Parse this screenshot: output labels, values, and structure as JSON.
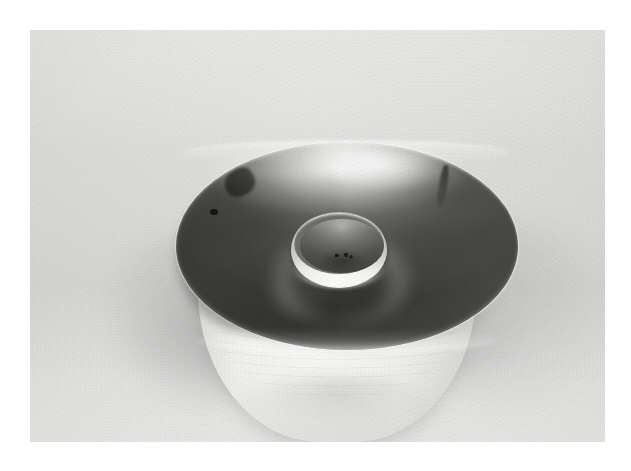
{
  "image": {
    "kind": "photograph",
    "medium": "black-and-white print",
    "subject": "ceramic bowl with raised central well",
    "orientation": "landscape",
    "canvas": {
      "width": 631,
      "height": 471,
      "background": "#ffffff"
    },
    "print": {
      "left": 30,
      "top": 30,
      "width": 575,
      "height": 412,
      "paper_color": "#dcdcda",
      "border_color": "#ffffff"
    }
  },
  "palette": {
    "paper_light": "#e4e4e2",
    "paper_mid": "#d4d4d2",
    "bowl_outer_light": "#f7f7f5",
    "bowl_interior_dark": "#4a4a46",
    "bowl_interior_mid": "#6e6e6a",
    "highlight_white": "#ffffff",
    "shadow_gray": "#8e8e8c",
    "blemish_black": "#0a0a0a"
  },
  "subject": {
    "name": "bowl",
    "parts": [
      {
        "id": "rim",
        "label": "bowl rim",
        "shape": "ellipse",
        "bounds": {
          "left": 146,
          "top": 112,
          "width": 342,
          "height": 208
        },
        "tone": "dark interior, bright lip"
      },
      {
        "id": "interior",
        "label": "concave interior",
        "tone": "dark gray, mottled, specular sweep across upper wall"
      },
      {
        "id": "well",
        "label": "central raised well",
        "shape": "ellipse",
        "bounds": {
          "left": 261,
          "top": 182,
          "width": 96,
          "height": 76
        },
        "tone": "bright rim, dark recess"
      },
      {
        "id": "body",
        "label": "outer bowl body",
        "bounds": {
          "left": 168,
          "top": 150,
          "width": 278,
          "height": 262
        },
        "tone": "very light, throwing rings visible"
      },
      {
        "id": "shadow",
        "label": "cast shadow",
        "tone": "soft, falls forward and to the left"
      }
    ],
    "marks": [
      {
        "id": "blemish-left",
        "label": "dark chip mark on upper-left rim"
      },
      {
        "id": "blemish-left2",
        "label": "small dark speck on left wall"
      },
      {
        "id": "blemish-right",
        "label": "dark hairline crack on right rim"
      },
      {
        "id": "blemish-center",
        "label": "dark speck near centre floor"
      }
    ]
  }
}
